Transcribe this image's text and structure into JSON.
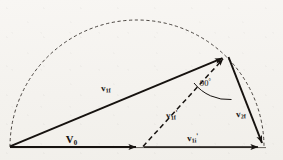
{
  "figure": {
    "background_color": "#f7f5f2",
    "ink_color": "#16120f",
    "labels": {
      "v1f": {
        "symbol": "v",
        "sub": "1f",
        "prime": "",
        "text": "v1f"
      },
      "v1ip": {
        "symbol": "v",
        "sub": "1f",
        "prime": "'",
        "text": "v1f'"
      },
      "v2f": {
        "symbol": "v",
        "sub": "2f",
        "prime": "",
        "text": "v2f"
      },
      "v0": {
        "symbol": "V",
        "sub": "0",
        "prime": "",
        "text": "V0"
      },
      "v1ib": {
        "symbol": "v",
        "sub": "1i",
        "prime": "'",
        "text": "v1i'"
      },
      "angle": {
        "value": "90",
        "unit": "°",
        "text": "90°"
      }
    },
    "geometry": {
      "origin": {
        "x": 10,
        "y": 147
      },
      "baseline_end": {
        "x": 265,
        "y": 147
      },
      "apex": {
        "x": 228,
        "y": 55
      },
      "v0_arrow_end": {
        "x": 143,
        "y": 147
      },
      "semicircle": {
        "cx": 137,
        "cy": 147,
        "r": 127,
        "style": "dashed"
      },
      "right_angle_marker": {
        "at": "apex",
        "degrees": 90
      }
    },
    "vectors": [
      {
        "name": "v0",
        "from": "origin",
        "to": "v0_arrow_end",
        "style": "solid",
        "arrow": true
      },
      {
        "name": "v1f",
        "from": "origin",
        "to": "apex",
        "style": "solid",
        "arrow": true
      },
      {
        "name": "v1ib",
        "from": "v0_arrow_end",
        "to": "baseline_end",
        "style": "solid",
        "arrow": true
      },
      {
        "name": "v1ip",
        "from": "v0_arrow_end",
        "to": "apex",
        "style": "dashed",
        "arrow": true
      },
      {
        "name": "v2f",
        "from": "apex",
        "to": "baseline_end",
        "style": "solid",
        "arrow": true
      }
    ]
  }
}
